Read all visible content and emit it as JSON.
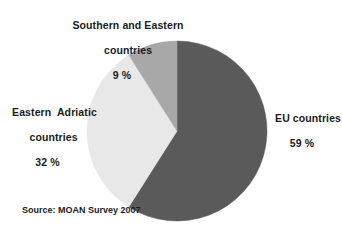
{
  "chart_data": {
    "type": "pie",
    "title": "",
    "subtitle": "",
    "xlabel": "",
    "ylabel": "",
    "legend_position": "none",
    "grid": false,
    "start_angle_deg": 0,
    "direction": "clockwise",
    "units": "%",
    "categories": [
      "EU countries",
      "Eastern  Adriatic countries",
      "Southern and Eastern countries"
    ],
    "values": [
      59,
      32,
      9
    ],
    "colors": [
      "#5a5a5a",
      "#e8e8e8",
      "#a8a8a8"
    ],
    "slices": [
      {
        "name": "EU countries",
        "label_line1": "EU countries",
        "value": 59,
        "value_label": "59 %",
        "color": "#5a5a5a",
        "start_deg": 0,
        "end_deg": 212.4
      },
      {
        "name": "Eastern Adriatic countries",
        "label_line1": "Eastern  Adriatic",
        "label_line2": "countries",
        "value": 32,
        "value_label": "32 %",
        "color": "#e8e8e8",
        "start_deg": 212.4,
        "end_deg": 327.6
      },
      {
        "name": "Southern and Eastern countries",
        "label_line1": "Southern and Eastern",
        "label_line2": "countries",
        "value": 9,
        "value_label": "9 %",
        "color": "#a8a8a8",
        "start_deg": 327.6,
        "end_deg": 360
      }
    ],
    "annotations": [
      "Source: MOAN Survey 2007"
    ]
  },
  "labels": {
    "southern_eastern": {
      "line1": "Southern and Eastern",
      "line2": "countries",
      "percent": "9 %"
    },
    "eastern_adriatic": {
      "line1": "Eastern  Adriatic",
      "line2": "countries",
      "percent": "32 %"
    },
    "eu": {
      "line1": "EU countries",
      "percent": "59 %"
    }
  },
  "source": {
    "text": "Source: MOAN Survey 2007"
  },
  "style": {
    "background": "#ffffff",
    "text_color": "#1b1b1b",
    "slice_eu_color": "#5a5a5a",
    "slice_adriatic_color": "#e8e8e8",
    "slice_southern_color": "#a8a8a8"
  }
}
